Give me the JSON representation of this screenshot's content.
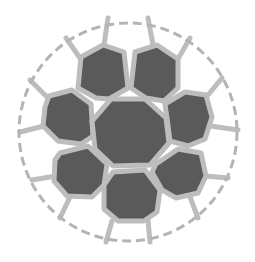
{
  "diagram": {
    "title": "",
    "colors": {
      "background": "#ffffff",
      "boundary": "#b4b4b4",
      "wall": "#bdbdbd",
      "inner_cell": "#5a5a5a",
      "outer_cell": "#ffffff"
    },
    "boundary": {
      "cx": 128,
      "cy": 132,
      "r": 109,
      "dash": "9 5"
    },
    "center_cell": {
      "points": "111,99 145,99 166,118 169,143 150,165 113,166 95,149 92,121"
    },
    "inner_cells": [
      {
        "name": "inner-cell-top-left",
        "points": "81,57 103,45 124,52 128,88 109,99 96,98 78,88"
      },
      {
        "name": "inner-cell-top-right",
        "points": "135,52 157,45 178,59 178,88 164,101 146,98 131,88"
      },
      {
        "name": "inner-cell-left",
        "points": "49,96 72,90 91,104 93,136 81,144 58,141 43,126 45,107"
      },
      {
        "name": "inner-cell-right",
        "points": "165,104 185,92 206,95 212,117 205,139 188,146 170,141 167,118"
      },
      {
        "name": "inner-cell-bottom-left",
        "points": "60,153 88,146 107,164 104,185 92,197 67,196 54,181 55,160"
      },
      {
        "name": "inner-cell-bottom-right",
        "points": "156,164 178,149 201,153 206,176 198,193 176,198 162,190 152,172"
      },
      {
        "name": "inner-cell-bottom",
        "points": "113,172 145,170 160,190 157,212 144,221 118,221 104,209 104,185"
      }
    ],
    "outer_walls": [
      "108,18 104,45",
      "148,18 153,45",
      "190,38 178,59",
      "222,78 208,95",
      "238,130 211,126",
      "228,178 205,176",
      "198,218 190,197",
      "150,242 148,220",
      "106,242 112,221",
      "60,218 70,197",
      "32,180 56,176",
      "20,132 44,126",
      "30,80 48,98",
      "66,38 80,58"
    ]
  }
}
